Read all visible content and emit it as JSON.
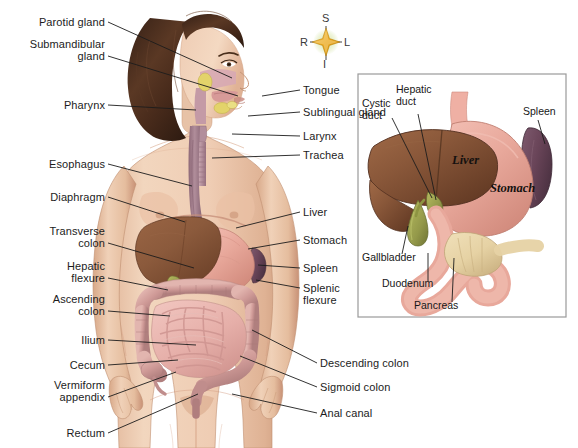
{
  "figure": {
    "background_color": "#ffffff"
  },
  "compass": {
    "name": "anatomical-orientation-rose",
    "superior": "S",
    "inferior": "I",
    "right": "R",
    "left": "L",
    "star_color": "#E8A317",
    "glow_color": "#DCE8B4"
  },
  "labels_left": [
    {
      "id": "parotid-gland",
      "text": "Parotid gland",
      "lines": [
        "Parotid gland"
      ],
      "x": 105,
      "y": 22,
      "lx": 108,
      "ly": 22,
      "tx": 232,
      "ty": 78
    },
    {
      "id": "submandibular-gland",
      "text": "Submandibular gland",
      "lines": [
        "Submandibular",
        "gland"
      ],
      "x": 105,
      "y": 44,
      "lx": 108,
      "ly": 56,
      "tx": 238,
      "ty": 96
    },
    {
      "id": "pharynx",
      "text": "Pharynx",
      "lines": [
        "Pharynx"
      ],
      "x": 105,
      "y": 105,
      "lx": 108,
      "ly": 105,
      "tx": 196,
      "ty": 110
    },
    {
      "id": "esophagus",
      "text": "Esophagus",
      "lines": [
        "Esophagus"
      ],
      "x": 105,
      "y": 164,
      "lx": 108,
      "ly": 164,
      "tx": 192,
      "ty": 186
    },
    {
      "id": "diaphragm",
      "text": "Diaphragm",
      "lines": [
        "Diaphragm"
      ],
      "x": 105,
      "y": 197,
      "lx": 108,
      "ly": 197,
      "tx": 185,
      "ty": 222
    },
    {
      "id": "transverse-colon",
      "text": "Transverse colon",
      "lines": [
        "Transverse",
        "colon"
      ],
      "x": 105,
      "y": 231,
      "lx": 108,
      "ly": 243,
      "tx": 194,
      "ty": 268
    },
    {
      "id": "hepatic-flexure",
      "text": "Hepatic flexure",
      "lines": [
        "Hepatic",
        "flexure"
      ],
      "x": 105,
      "y": 266,
      "lx": 108,
      "ly": 278,
      "tx": 168,
      "ty": 290
    },
    {
      "id": "ascending-colon",
      "text": "Ascending colon",
      "lines": [
        "Ascending",
        "colon"
      ],
      "x": 105,
      "y": 299,
      "lx": 108,
      "ly": 311,
      "tx": 170,
      "ty": 316
    },
    {
      "id": "ilium",
      "text": "Ilium",
      "lines": [
        "Ilium"
      ],
      "x": 105,
      "y": 340,
      "lx": 108,
      "ly": 340,
      "tx": 196,
      "ty": 345
    },
    {
      "id": "cecum",
      "text": "Cecum",
      "lines": [
        "Cecum"
      ],
      "x": 105,
      "y": 365,
      "lx": 108,
      "ly": 365,
      "tx": 178,
      "ty": 360
    },
    {
      "id": "vermiform-appendix",
      "text": "Vermiform appendix",
      "lines": [
        "Vermiform",
        "appendix"
      ],
      "x": 105,
      "y": 385,
      "lx": 108,
      "ly": 397,
      "tx": 176,
      "ty": 372
    },
    {
      "id": "rectum",
      "text": "Rectum",
      "lines": [
        "Rectum"
      ],
      "x": 105,
      "y": 433,
      "lx": 108,
      "ly": 433,
      "tx": 198,
      "ty": 394
    }
  ],
  "labels_right": [
    {
      "id": "tongue",
      "text": "Tongue",
      "lines": [
        "Tongue"
      ],
      "x": 303,
      "y": 90,
      "lx": 300,
      "ly": 90,
      "tx": 262,
      "ty": 96
    },
    {
      "id": "sublingual-gland",
      "text": "Sublingual gland",
      "lines": [
        "Sublingual gland"
      ],
      "x": 303,
      "y": 112,
      "lx": 300,
      "ly": 112,
      "tx": 248,
      "ty": 116
    },
    {
      "id": "larynx",
      "text": "Larynx",
      "lines": [
        "Larynx"
      ],
      "x": 303,
      "y": 136,
      "lx": 300,
      "ly": 136,
      "tx": 232,
      "ty": 134
    },
    {
      "id": "trachea",
      "text": "Trachea",
      "lines": [
        "Trachea"
      ],
      "x": 303,
      "y": 155,
      "lx": 300,
      "ly": 155,
      "tx": 212,
      "ty": 158
    },
    {
      "id": "liver",
      "text": "Liver",
      "lines": [
        "Liver"
      ],
      "x": 303,
      "y": 212,
      "lx": 300,
      "ly": 212,
      "tx": 236,
      "ty": 228
    },
    {
      "id": "stomach",
      "text": "Stomach",
      "lines": [
        "Stomach"
      ],
      "x": 303,
      "y": 240,
      "lx": 300,
      "ly": 240,
      "tx": 248,
      "ty": 249
    },
    {
      "id": "spleen",
      "text": "Spleen",
      "lines": [
        "Spleen"
      ],
      "x": 303,
      "y": 268,
      "lx": 300,
      "ly": 268,
      "tx": 258,
      "ty": 265
    },
    {
      "id": "splenic-flexure",
      "text": "Splenic flexure",
      "lines": [
        "Splenic",
        "flexure"
      ],
      "x": 303,
      "y": 288,
      "lx": 300,
      "ly": 288,
      "tx": 256,
      "ty": 280
    },
    {
      "id": "descending-colon",
      "text": "Descending colon",
      "lines": [
        "Descending colon"
      ],
      "x": 320,
      "y": 363,
      "lx": 317,
      "ly": 363,
      "tx": 252,
      "ty": 330
    },
    {
      "id": "sigmoid-colon",
      "text": "Sigmoid colon",
      "lines": [
        "Sigmoid colon"
      ],
      "x": 320,
      "y": 387,
      "lx": 317,
      "ly": 387,
      "tx": 240,
      "ty": 356
    },
    {
      "id": "anal-canal",
      "text": "Anal canal",
      "lines": [
        "Anal canal"
      ],
      "x": 320,
      "y": 413,
      "lx": 317,
      "ly": 413,
      "tx": 232,
      "ty": 394
    }
  ],
  "inset": {
    "name": "upper-abdominal-organs-detail",
    "border_color": "#9a9a9a",
    "background": "#ffffff",
    "box": {
      "x": 358,
      "y": 74,
      "width": 208,
      "height": 243
    },
    "organ_names": [
      {
        "id": "inset-liver-name",
        "text": "Liver",
        "x": 452,
        "y": 160
      },
      {
        "id": "inset-stomach-name",
        "text": "Stomach",
        "x": 490,
        "y": 188
      }
    ],
    "labels": [
      {
        "id": "inset-cystic-duct",
        "text": "Cystic duct",
        "lines": [
          "Cystic",
          "duct"
        ],
        "x": 362,
        "y": 104,
        "align": "left",
        "lx": 392,
        "ly": 118,
        "tx": 432,
        "ty": 198
      },
      {
        "id": "inset-hepatic-duct",
        "text": "Hepatic duct",
        "lines": [
          "Hepatic",
          "duct"
        ],
        "x": 396,
        "y": 90,
        "align": "left",
        "lx": 418,
        "ly": 114,
        "tx": 436,
        "ty": 200
      },
      {
        "id": "inset-spleen",
        "text": "Spleen",
        "lines": [
          "Spleen"
        ],
        "x": 523,
        "y": 112,
        "align": "left",
        "lx": 538,
        "ly": 120,
        "tx": 545,
        "ty": 144
      },
      {
        "id": "inset-gallbladder",
        "text": "Gallbladder",
        "lines": [
          "Gallbladder"
        ],
        "x": 362,
        "y": 258,
        "align": "left",
        "lx": 402,
        "ly": 254,
        "tx": 408,
        "ty": 226
      },
      {
        "id": "inset-duodenum",
        "text": "Duodenum",
        "lines": [
          "Duodenum"
        ],
        "x": 382,
        "y": 284,
        "align": "left",
        "lx": 428,
        "ly": 281,
        "tx": 428,
        "ty": 253
      },
      {
        "id": "inset-pancreas",
        "text": "Pancreas",
        "lines": [
          "Pancreas"
        ],
        "x": 414,
        "y": 306,
        "align": "left",
        "lx": 452,
        "ly": 302,
        "tx": 454,
        "ty": 258
      }
    ]
  },
  "palette": {
    "liver": "#8B5A3C",
    "liver_dark": "#6E432C",
    "stomach": "#E8A89B",
    "stomach_dark": "#D78B7E",
    "spleen": "#6E4A5E",
    "spleen_dark": "#533848",
    "pancreas": "#E8D4A8",
    "gallbladder": "#9AA04A",
    "colon": "#CF9A97",
    "colon_light": "#E3B3AE",
    "small_intestine": "#E9B3AE",
    "skin": "#EFCDB4",
    "skin_shadow": "#D9AE90",
    "hair": "#4A2F22",
    "hair_light": "#6B4530",
    "esophagus": "#A8808E",
    "pharynx": "#C49AA6",
    "salivary": "#E3D36A",
    "leader_line": "#1c1c1c"
  }
}
